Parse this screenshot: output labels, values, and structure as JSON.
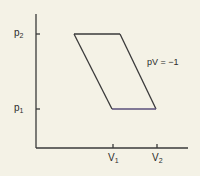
{
  "diagram": {
    "type": "pV diagram",
    "y_ticks": [
      {
        "label": "p",
        "sub": "2"
      },
      {
        "label": "p",
        "sub": "1"
      }
    ],
    "x_ticks": [
      {
        "label": "V",
        "sub": "1"
      },
      {
        "label": "V",
        "sub": "2"
      }
    ],
    "curve_label": "pV = −1",
    "colors": {
      "line": "#3a3a3a",
      "background": "#f4f2e6",
      "bottom_edge": "#5a4f7a"
    }
  }
}
